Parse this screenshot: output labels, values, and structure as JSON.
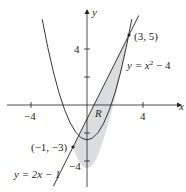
{
  "figure": {
    "type": "region-between-curves",
    "axes": {
      "x_label": "x",
      "y_label": "y",
      "x_ticks": [
        -4,
        4
      ],
      "y_ticks": [
        4,
        -4
      ],
      "x_tick_labels": [
        "−4",
        "4"
      ],
      "y_tick_labels": [
        "4",
        "−4"
      ]
    },
    "curves": [
      {
        "name": "parabola",
        "equation": "y = x² − 4",
        "label_prefix": "y = x",
        "label_sup": "2",
        "label_suffix": " − 4"
      },
      {
        "name": "line",
        "equation": "y = 2x − 1",
        "label": "y = 2x − 1"
      }
    ],
    "intersection_points": [
      {
        "label": "(3, 5)",
        "x": 3,
        "y": 5
      },
      {
        "label": "(−1, −3)",
        "x": -1,
        "y": -3
      }
    ],
    "region": {
      "label": "R",
      "fill": "#dcdddf"
    },
    "colors": {
      "stroke": "#231f20",
      "fill": "#dcdddf",
      "background": "#ffffff"
    }
  }
}
